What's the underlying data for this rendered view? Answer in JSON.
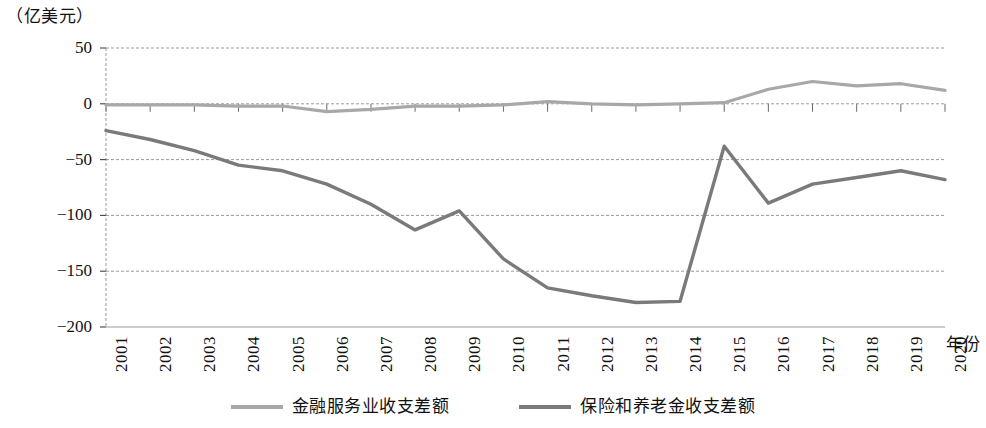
{
  "chart_data": {
    "type": "line",
    "title": "",
    "unit_caption": "（亿美元）",
    "xlabel": "年份",
    "ylabel": "",
    "categories": [
      "2001",
      "2002",
      "2003",
      "2004",
      "2005",
      "2006",
      "2007",
      "2008",
      "2009",
      "2010",
      "2011",
      "2012",
      "2013",
      "2014",
      "2015",
      "2016",
      "2017",
      "2018",
      "2019",
      "2020"
    ],
    "ylim": [
      -200,
      50
    ],
    "yticks": [
      50,
      0,
      -50,
      -100,
      -150,
      -200
    ],
    "ytick_labels": [
      "50",
      "0",
      "-50",
      "-100",
      "-150",
      "-200"
    ],
    "grid": true,
    "legend_position": "bottom",
    "series": [
      {
        "name": "金融服务业收支差额",
        "color": "#a8a8a8",
        "values": [
          -1,
          -1,
          -1,
          -2,
          -2,
          -7,
          -5,
          -2,
          -2,
          -1,
          2,
          0,
          -1,
          0,
          1,
          13,
          20,
          16,
          18,
          12
        ]
      },
      {
        "name": "保险和养老金收支差额",
        "color": "#7a7a7a",
        "values": [
          -24,
          -32,
          -42,
          -55,
          -60,
          -72,
          -90,
          -113,
          -96,
          -139,
          -165,
          -172,
          -178,
          -177,
          -38,
          -89,
          -72,
          -66,
          -60,
          -68
        ]
      }
    ]
  },
  "axes": {
    "x_title": "年份",
    "unit_caption": "（亿美元）"
  },
  "legend": {
    "items": [
      {
        "label": "金融服务业收支差额",
        "color": "#a8a8a8"
      },
      {
        "label": "保险和养老金收支差额",
        "color": "#7a7a7a"
      }
    ]
  },
  "colors": {
    "grid": "#9a9a9a",
    "axis": "#3a3a3a",
    "series_financial": "#a8a8a8",
    "series_insurance": "#7a7a7a",
    "background": "#ffffff"
  }
}
